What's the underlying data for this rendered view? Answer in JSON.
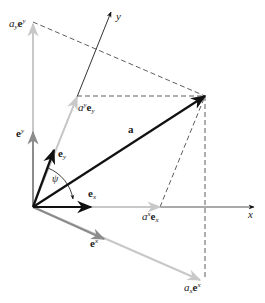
{
  "diagram": {
    "type": "vector decomposition in oblique (non-orthogonal) coordinate system",
    "axes": {
      "x_label": "x",
      "y_label": "y"
    },
    "vector": {
      "label": "a"
    },
    "angle": {
      "label": "ψ"
    },
    "basis_covariant": {
      "ex_label": "e",
      "ex_sub": "x",
      "ey_label": "e",
      "ey_sub": "y"
    },
    "basis_contravariant": {
      "ex_label": "e",
      "ex_sup": "x",
      "ey_label": "e",
      "ey_sup": "y"
    },
    "components": {
      "axex": {
        "coef": "a",
        "coef_sup": "x",
        "vec": "e",
        "vec_sub": "x"
      },
      "ayey": {
        "coef": "a",
        "coef_sup": "y",
        "vec": "e",
        "vec_sub": "y"
      },
      "ax_ex": {
        "coef": "a",
        "coef_sub": "x",
        "vec": "e",
        "vec_sup": "x"
      },
      "ay_ey": {
        "coef": "a",
        "coef_sub": "y",
        "vec": "e",
        "vec_sup": "y"
      }
    },
    "colors": {
      "black": "#111111",
      "gray": "#8c8c8c",
      "light_gray": "#c8c8c8",
      "dash": "#333333"
    }
  }
}
